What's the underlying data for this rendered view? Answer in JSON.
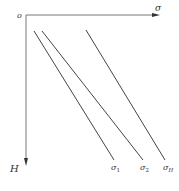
{
  "diagram": {
    "origin_label": "o",
    "x_axis_label": "σ",
    "y_axis_label": "H",
    "lines": [
      {
        "label_main": "σ",
        "label_sub": "1",
        "x1": 34,
        "y1": 31,
        "x2": 114,
        "y2": 160
      },
      {
        "label_main": "σ",
        "label_sub": "2",
        "x1": 42,
        "y1": 31,
        "x2": 143,
        "y2": 160
      },
      {
        "label_main": "σ",
        "label_sub": "H",
        "x1": 86,
        "y1": 30,
        "x2": 165,
        "y2": 160
      }
    ],
    "colors": {
      "axis": "#555555",
      "line": "#444444",
      "text": "#333333"
    }
  }
}
